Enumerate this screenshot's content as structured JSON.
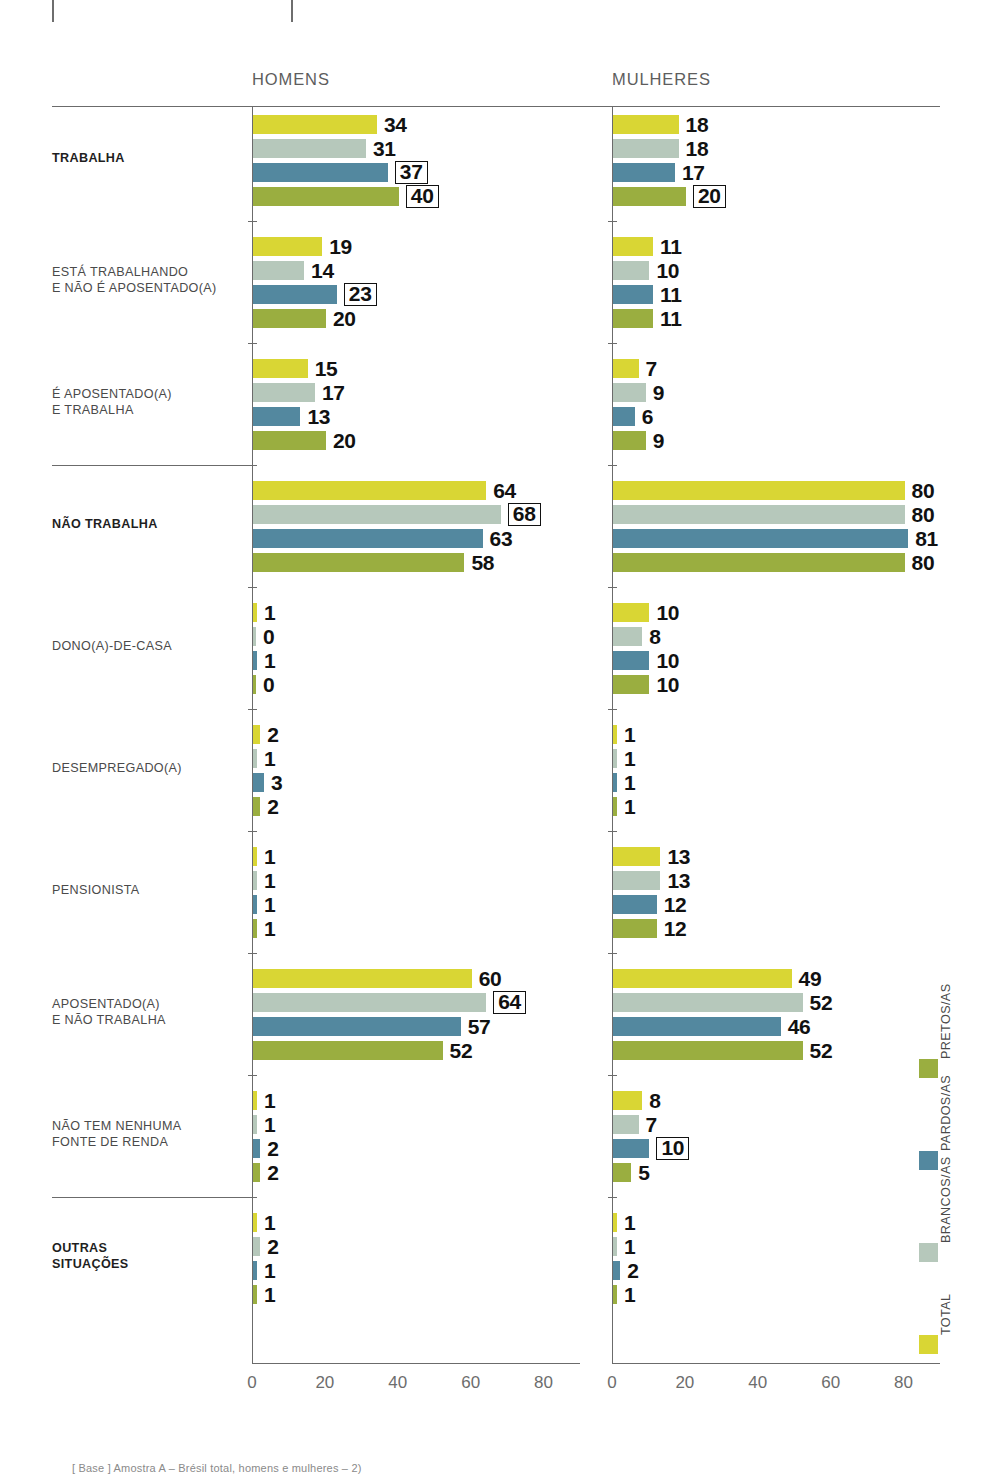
{
  "crop_marks": 2,
  "panels": [
    {
      "key": "homens",
      "title": "HOMENS"
    },
    {
      "key": "mulheres",
      "title": "MULHERES"
    }
  ],
  "legend": {
    "items": [
      {
        "label": "TOTAL",
        "color": "#d9d634"
      },
      {
        "label": "BRANCOS/AS",
        "color": "#b6c8bb"
      },
      {
        "label": "PARDOS/AS",
        "color": "#53889f"
      },
      {
        "label": "PRETOS/AS",
        "color": "#9aae40"
      }
    ]
  },
  "axis": {
    "ticks": [
      "0",
      "20",
      "40",
      "60",
      "80"
    ],
    "min": 0,
    "max": 90
  },
  "footer": "[ Base ] Amostra  A – Brésil total, homens e mulheres – 2)",
  "chart_data": {
    "type": "bar",
    "orientation": "horizontal",
    "xlabel": "",
    "ylabel": "",
    "xlim": [
      0,
      90
    ],
    "grid": false,
    "legend_position": "right-vertical",
    "series": [
      {
        "name": "TOTAL",
        "color": "#d9d634"
      },
      {
        "name": "BRANCOS/AS",
        "color": "#b6c8bb"
      },
      {
        "name": "PARDOS/AS",
        "color": "#53889f"
      },
      {
        "name": "PRETOS/AS",
        "color": "#9aae40"
      }
    ],
    "categories": [
      "TRABALHA",
      "ESTÁ TRABALHANDO E NÃO É APOSENTADO(A)",
      "É APOSENTADO(A) E TRABALHA",
      "NÃO TRABALHA",
      "DONO(A)-DE-CASA",
      "DESEMPREGADO(A)",
      "PENSIONISTA",
      "APOSENTADO(A) E NÃO TRABALHA",
      "NÃO TEM NENHUMA FONTE DE RENDA",
      "OUTRAS SITUAÇÕES"
    ],
    "panels": {
      "homens": {
        "label": "HOMENS",
        "values": {
          "TRABALHA": [
            34,
            31,
            37,
            40
          ],
          "ESTÁ TRABALHANDO E NÃO É APOSENTADO(A)": [
            19,
            14,
            23,
            20
          ],
          "É APOSENTADO(A) E TRABALHA": [
            15,
            17,
            13,
            20
          ],
          "NÃO TRABALHA": [
            64,
            68,
            63,
            58
          ],
          "DONO(A)-DE-CASA": [
            1,
            0,
            1,
            0
          ],
          "DESEMPREGADO(A)": [
            2,
            1,
            3,
            2
          ],
          "PENSIONISTA": [
            1,
            1,
            1,
            1
          ],
          "APOSENTADO(A) E NÃO TRABALHA": [
            60,
            64,
            57,
            52
          ],
          "NÃO TEM NENHUMA FONTE DE RENDA": [
            1,
            1,
            2,
            2
          ],
          "OUTRAS SITUAÇÕES": [
            1,
            2,
            1,
            1
          ]
        },
        "highlighted": {
          "TRABALHA": [
            2,
            3
          ],
          "ESTÁ TRABALHANDO E NÃO É APOSENTADO(A)": [
            2
          ],
          "NÃO TRABALHA": [
            1
          ],
          "APOSENTADO(A) E NÃO TRABALHA": [
            1
          ]
        }
      },
      "mulheres": {
        "label": "MULHERES",
        "values": {
          "TRABALHA": [
            18,
            18,
            17,
            20
          ],
          "ESTÁ TRABALHANDO E NÃO É APOSENTADO(A)": [
            11,
            10,
            11,
            11
          ],
          "É APOSENTADO(A) E TRABALHA": [
            7,
            9,
            6,
            9
          ],
          "NÃO TRABALHA": [
            80,
            80,
            81,
            80
          ],
          "DONO(A)-DE-CASA": [
            10,
            8,
            10,
            10
          ],
          "DESEMPREGADO(A)": [
            1,
            1,
            1,
            1
          ],
          "PENSIONISTA": [
            13,
            13,
            12,
            12
          ],
          "APOSENTADO(A) E NÃO TRABALHA": [
            49,
            52,
            46,
            52
          ],
          "NÃO TEM NENHUMA FONTE DE RENDA": [
            8,
            7,
            10,
            5
          ],
          "OUTRAS SITUAÇÕES": [
            1,
            1,
            2,
            1
          ]
        },
        "highlighted": {
          "TRABALHA": [
            3
          ],
          "NÃO TEM NENHUMA FONTE DE RENDA": [
            2
          ]
        }
      }
    },
    "category_styles": {
      "TRABALHA": "bold",
      "NÃO TRABALHA": "bold",
      "OUTRAS SITUAÇÕES": "bold"
    },
    "separator_rules_after": [
      "É APOSENTADO(A) E TRABALHA",
      "NÃO TEM NENHUMA FONTE DE RENDA"
    ]
  }
}
